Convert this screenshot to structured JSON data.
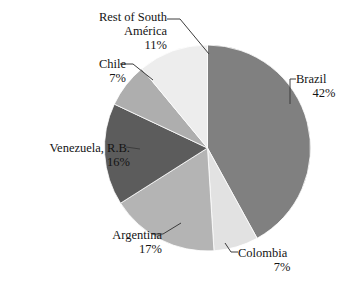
{
  "chart_data": {
    "type": "pie",
    "title": "",
    "subtitle": "",
    "xlabel": "",
    "ylabel": "",
    "legend_position": "none",
    "grid": false,
    "labels_outside": true,
    "start_angle_deg": 0,
    "direction": "clockwise",
    "categories": [
      "Brazil",
      "Colombia",
      "Argentina",
      "Venezuela, R.B.",
      "Chile",
      "Rest of South América"
    ],
    "values": [
      42,
      17,
      17,
      16,
      7,
      11
    ],
    "units": "%",
    "slices": [
      {
        "label": "Brazil",
        "value": 42,
        "display": "42%",
        "color": "#808080"
      },
      {
        "label": "Colombia",
        "value": 7,
        "display": "7%",
        "color": "#e2e2e2"
      },
      {
        "label": "Argentina",
        "value": 17,
        "display": "17%",
        "color": "#b4b4b4"
      },
      {
        "label": "Venezuela, R.B.",
        "value": 16,
        "display": "16%",
        "color": "#5c5c5c"
      },
      {
        "label": "Chile",
        "value": 7,
        "display": "7%",
        "color": "#aeaeae"
      },
      {
        "label": "Rest of South América",
        "value": 11,
        "display": "11%",
        "color": "#ededed"
      }
    ]
  },
  "labels": {
    "brazil": {
      "name": "Brazil",
      "pct": "42%"
    },
    "colombia": {
      "name": "Colombia",
      "pct": "7%"
    },
    "argentina": {
      "name": "Argentina",
      "pct": "17%"
    },
    "venezuela": {
      "name": "Venezuela, R.B.",
      "pct": "16%"
    },
    "chile": {
      "name": "Chile",
      "pct": "7%"
    },
    "rest": {
      "name_line1": "Rest of South",
      "name_line2": "América",
      "pct": "11%"
    }
  },
  "colors": {
    "background": "#ffffff",
    "text": "#141414",
    "leader_line": "#3c3c3c"
  }
}
